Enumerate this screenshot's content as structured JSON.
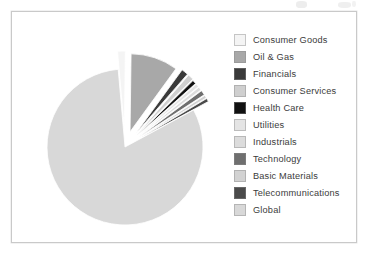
{
  "figure": {
    "background_color": "#ffffff",
    "frame_color": "#c9c9c9"
  },
  "chart_data": {
    "type": "pie",
    "title": "",
    "subtitle": "",
    "xlabel": "",
    "ylabel": "",
    "legend_position": "right",
    "grid": false,
    "exploded": true,
    "start_angle_deg": -95,
    "direction": "clockwise",
    "center": {
      "x": 113,
      "y": 135
    },
    "radius": 78,
    "categories": [
      "Consumer Goods",
      "Oil & Gas",
      "Financials",
      "Consumer Services",
      "Health Care",
      "Utilities",
      "Industrials",
      "Technology",
      "Basic Materials",
      "Telecommunications",
      "Global"
    ],
    "values": [
      1.6,
      9.8,
      1.4,
      1.2,
      0.8,
      0.7,
      0.7,
      1.0,
      0.6,
      0.7,
      81.5
    ],
    "colors": [
      "#f4f4f4",
      "#a8a8a8",
      "#3a3a3a",
      "#cfcfcf",
      "#111111",
      "#e4e4e4",
      "#dcdcdc",
      "#6f6f6f",
      "#d2d2d2",
      "#4a4a4a",
      "#d8d8d8"
    ],
    "offsets": [
      18,
      16,
      18,
      18,
      17,
      17,
      17,
      17,
      17,
      17,
      0
    ]
  },
  "legend": {
    "items": [
      {
        "label": "Consumer Goods",
        "color": "#f4f4f4"
      },
      {
        "label": "Oil & Gas",
        "color": "#a8a8a8"
      },
      {
        "label": "Financials",
        "color": "#3a3a3a"
      },
      {
        "label": "Consumer Services",
        "color": "#cfcfcf"
      },
      {
        "label": "Health Care",
        "color": "#111111"
      },
      {
        "label": "Utilities",
        "color": "#e4e4e4"
      },
      {
        "label": "Industrials",
        "color": "#dcdcdc"
      },
      {
        "label": "Technology",
        "color": "#6f6f6f"
      },
      {
        "label": "Basic Materials",
        "color": "#d2d2d2"
      },
      {
        "label": "Telecommunications",
        "color": "#4a4a4a"
      },
      {
        "label": "Global",
        "color": "#d8d8d8"
      }
    ]
  }
}
